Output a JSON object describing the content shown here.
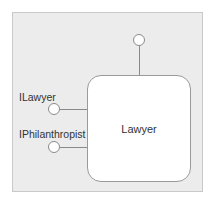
{
  "diagram": {
    "type": "component-interface-diagram",
    "component": {
      "label": "Lawyer"
    },
    "interfaces": [
      {
        "label": "ILawyer",
        "side": "left"
      },
      {
        "label": "IPhilanthropist",
        "side": "left"
      },
      {
        "label": "",
        "side": "top"
      }
    ],
    "colors": {
      "frame_fill": "#ececec",
      "frame_border": "#c9c9c9",
      "component_fill": "#ffffff",
      "line": "#8a8a8a",
      "text": "#333333"
    }
  }
}
